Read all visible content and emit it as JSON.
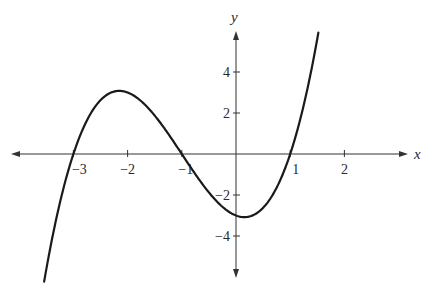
{
  "chart_data": {
    "type": "line",
    "title": "",
    "xlabel": "x",
    "ylabel": "y",
    "function": "y = (x+3)(x+1)(x-1) = x^3 + 3x^2 - x - 3",
    "coefficients_descending": [
      1,
      3,
      -1,
      -3
    ],
    "x_domain": [
      -3.54,
      1.52
    ],
    "xlim": [
      -4.2,
      3.3
    ],
    "ylim": [
      -6,
      6
    ],
    "grid": false,
    "legend": "none",
    "x_ticks": [
      {
        "value": -3,
        "label": "−3"
      },
      {
        "value": -2,
        "label": "−2"
      },
      {
        "value": -1,
        "label": "−1"
      },
      {
        "value": 1,
        "label": "1"
      },
      {
        "value": 2,
        "label": "2"
      }
    ],
    "y_ticks": [
      {
        "value": 4,
        "label": "4"
      },
      {
        "value": 2,
        "label": "2"
      },
      {
        "value": -2,
        "label": "−2"
      },
      {
        "value": -4,
        "label": "−4"
      }
    ],
    "key_points": {
      "x_intercepts": [
        -3,
        -1,
        1
      ],
      "y_intercept": -3,
      "local_max": {
        "x": -2.15,
        "y": 3.08
      },
      "local_min": {
        "x": 0.15,
        "y": -3.08
      }
    },
    "series": [
      {
        "name": "cubic",
        "color": "#1a1a1a"
      }
    ]
  }
}
